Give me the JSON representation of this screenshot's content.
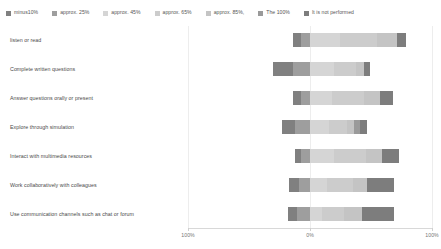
{
  "chart_data": {
    "type": "bar",
    "subtype": "diverging-stacked-bar",
    "title": "",
    "xlabel": "",
    "ylabel": "",
    "orientation": "horizontal",
    "grid": false,
    "legend_position": "top",
    "xlim": [
      -100,
      100
    ],
    "x_ticks": [
      "100%",
      "0%",
      "100%"
    ],
    "x_tick_values": [
      -100,
      0,
      100
    ],
    "categories": [
      "listen or read",
      "Complete written questions",
      "Answer questions orally or present",
      "Explore through simulation",
      "Interact with multimedia resources",
      "Work collaboratively with colleagues",
      "Use communication channels such as chat or forum"
    ],
    "series": [
      {
        "name": "minus10%",
        "color": "#808080",
        "values": [
          7,
          16,
          7,
          11,
          5,
          8,
          7
        ]
      },
      {
        "name": "approx. 25%",
        "color": "#9e9e9e",
        "values": [
          7,
          14,
          7,
          12,
          7,
          9,
          11
        ]
      },
      {
        "name": "approx. 45%",
        "color": "#d5d5d5",
        "values": [
          25,
          20,
          18,
          16,
          20,
          14,
          10
        ]
      },
      {
        "name": "approx. 65%",
        "color": "#cccccc",
        "values": [
          30,
          18,
          26,
          14,
          26,
          21,
          18
        ]
      },
      {
        "name": "approx. 85%",
        "color": "#c4c4c4",
        "values": [
          16,
          6,
          13,
          6,
          13,
          12,
          15
        ]
      },
      {
        "name": "The 100%",
        "color": "#9a9a9a",
        "values": [
          0,
          0,
          0,
          5,
          0,
          0,
          0
        ]
      },
      {
        "name": "It is not performed",
        "color": "#7d7d7d",
        "values": [
          8,
          5,
          11,
          6,
          14,
          22,
          26
        ]
      }
    ]
  },
  "legend": {
    "items": [
      {
        "label": "minus10%",
        "color": "#808080"
      },
      {
        "label": "approx. 25%",
        "color": "#9e9e9e"
      },
      {
        "label": "approx. 45%",
        "color": "#d5d5d5"
      },
      {
        "label": "approx. 65%",
        "color": "#cccccc"
      },
      {
        "label": "approx. 85%,",
        "color": "#c4c4c4"
      },
      {
        "label": "The 100%",
        "color": "#9a9a9a"
      },
      {
        "label": "It is not performed",
        "color": "#7d7d7d"
      }
    ]
  }
}
